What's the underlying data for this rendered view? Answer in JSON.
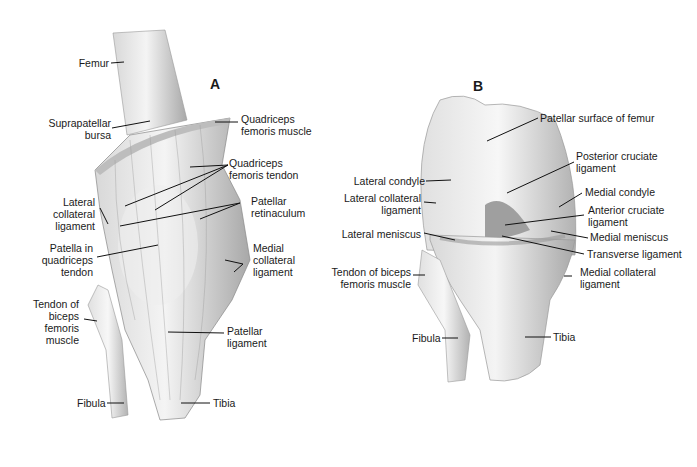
{
  "panels": {
    "a": "A",
    "b": "B"
  },
  "panel_a": {
    "labels": [
      {
        "id": "femur",
        "text": "Femur"
      },
      {
        "id": "suprapatellar-bursa",
        "text": "Suprapatellar\nbursa"
      },
      {
        "id": "quadriceps-femoris-muscle",
        "text": "Quadriceps\nfemoris muscle"
      },
      {
        "id": "quadriceps-femoris-tendon",
        "text": "Quadriceps\nfemoris tendon"
      },
      {
        "id": "lateral-collateral-ligament",
        "text": "Lateral\ncollateral\nligament"
      },
      {
        "id": "patellar-retinaculum",
        "text": "Patellar\nretinaculum"
      },
      {
        "id": "patella-in-quadriceps-tendon",
        "text": "Patella in\nquadriceps\ntendon"
      },
      {
        "id": "medial-collateral-ligament",
        "text": "Medial\ncollateral\nligament"
      },
      {
        "id": "tendon-of-biceps-femoris-muscle",
        "text": "Tendon of\nbiceps\nfemoris\nmuscle"
      },
      {
        "id": "patellar-ligament",
        "text": "Patellar\nligament"
      },
      {
        "id": "fibula",
        "text": "Fibula"
      },
      {
        "id": "tibia",
        "text": "Tibia"
      }
    ]
  },
  "panel_b": {
    "labels": [
      {
        "id": "patellar-surface-of-femur",
        "text": "Patellar surface of femur"
      },
      {
        "id": "posterior-cruciate-ligament",
        "text": "Posterior cruciate\nligament"
      },
      {
        "id": "lateral-condyle",
        "text": "Lateral condyle"
      },
      {
        "id": "medial-condyle",
        "text": "Medial condyle"
      },
      {
        "id": "lateral-collateral-ligament",
        "text": "Lateral collateral\nligament"
      },
      {
        "id": "anterior-cruciate-ligament",
        "text": "Anterior cruciate\nligament"
      },
      {
        "id": "lateral-meniscus",
        "text": "Lateral meniscus"
      },
      {
        "id": "medial-meniscus",
        "text": "Medial meniscus"
      },
      {
        "id": "transverse-ligament",
        "text": "Transverse ligament"
      },
      {
        "id": "tendon-of-biceps-femoris-muscle",
        "text": "Tendon of biceps\nfemoris muscle"
      },
      {
        "id": "medial-collateral-ligament",
        "text": "Medial collateral\nligament"
      },
      {
        "id": "fibula",
        "text": "Fibula"
      },
      {
        "id": "tibia",
        "text": "Tibia"
      }
    ]
  },
  "colors": {
    "bone_light": "#f2f2f2",
    "bone_mid": "#cfcfcf",
    "bone_dark": "#9a9a9a",
    "line": "#111111"
  }
}
